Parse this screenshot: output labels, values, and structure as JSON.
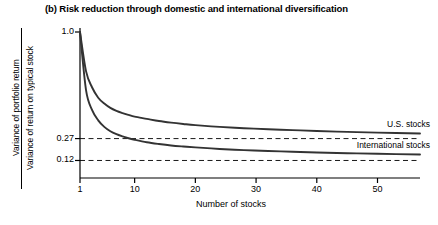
{
  "chart_data": {
    "type": "line",
    "title": "(b) Risk reduction through domestic and international diversification",
    "xlabel": "Number of stocks",
    "ylabel_numerator": "Variance of portfolio return",
    "ylabel_denominator": "Variance of return on typical stock",
    "xlim": [
      1,
      57
    ],
    "ylim": [
      0.0,
      1.0
    ],
    "xticks": [
      1,
      10,
      20,
      30,
      40,
      50
    ],
    "xtick_labels": [
      "1",
      "10",
      "20",
      "30",
      "40",
      "50"
    ],
    "yticks": [
      1.0,
      0.27,
      0.12
    ],
    "ytick_labels": [
      "1.0",
      "0.27",
      "0.12"
    ],
    "grid": false,
    "legend_position": "right-inline",
    "reference_lines": [
      {
        "name": "us-asymptote",
        "value": 0.27,
        "style": "dashed"
      },
      {
        "name": "international-asymptote",
        "value": 0.12,
        "style": "dashed"
      }
    ],
    "series": [
      {
        "name": "U.S. stocks",
        "label": "U.S. stocks",
        "color": "#333333",
        "asymptote": 0.27,
        "x": [
          1,
          2,
          3,
          4,
          5,
          6,
          7,
          8,
          9,
          10,
          12,
          14,
          16,
          18,
          20,
          24,
          28,
          32,
          36,
          40,
          45,
          50,
          57
        ],
        "y": [
          1.0,
          0.73,
          0.62,
          0.55,
          0.51,
          0.48,
          0.46,
          0.445,
          0.432,
          0.42,
          0.405,
          0.39,
          0.379,
          0.37,
          0.362,
          0.35,
          0.341,
          0.334,
          0.328,
          0.322,
          0.316,
          0.311,
          0.305
        ]
      },
      {
        "name": "International stocks",
        "label": "International stocks",
        "color": "#333333",
        "asymptote": 0.12,
        "x": [
          1,
          2,
          3,
          4,
          5,
          6,
          7,
          8,
          9,
          10,
          12,
          14,
          16,
          18,
          20,
          24,
          28,
          32,
          36,
          40,
          45,
          50,
          57
        ],
        "y": [
          1.0,
          0.6,
          0.465,
          0.395,
          0.35,
          0.32,
          0.3,
          0.285,
          0.272,
          0.262,
          0.245,
          0.233,
          0.223,
          0.216,
          0.21,
          0.199,
          0.191,
          0.185,
          0.18,
          0.175,
          0.17,
          0.166,
          0.161
        ]
      }
    ]
  }
}
